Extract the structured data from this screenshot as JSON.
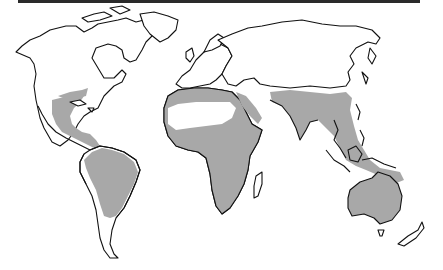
{
  "figure": {
    "type": "world-map",
    "style": "black outline, gray shaded distribution",
    "colors": {
      "land_outline": "#111111",
      "land_fill": "#ffffff",
      "shaded_region": "#a8a8a8",
      "background": "#ffffff",
      "top_rule": "#2a2a2a"
    },
    "shaded_regions": [
      "Southeastern North America (Gulf coast)",
      "Mexico and Central America",
      "South America (Amazon basin to northern Argentina)",
      "Northern Africa coastal strip (Mediterranean)",
      "Sub-Saharan Africa",
      "Arabian Peninsula west coast",
      "South and Southeast Asia (India, Indochina, southern China)",
      "Maritime Southeast Asia (Indonesia, Philippines, New Guinea)",
      "Australia"
    ],
    "unshaded_notable": [
      "Sahara Desert",
      "Madagascar",
      "Southern South America (Patagonia)",
      "Tasmania",
      "New Zealand"
    ]
  }
}
